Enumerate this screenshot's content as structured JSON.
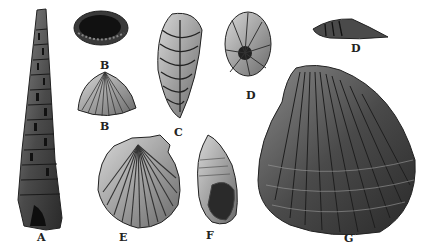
{
  "plate": {
    "subject": "Illustrated plate of fossil shells",
    "background": "#ffffff",
    "ink": "#222222",
    "specimens": [
      {
        "id": "A",
        "label": "A",
        "shape": "tall turreted gastropod (tower shell)"
      },
      {
        "id": "B1",
        "label": "B",
        "shape": "brachiopod valve, interior view"
      },
      {
        "id": "B2",
        "label": "B",
        "shape": "brachiopod valve, exterior ribbed view"
      },
      {
        "id": "C",
        "label": "C",
        "shape": "elongate chambered foraminifer"
      },
      {
        "id": "D1",
        "label": "D",
        "shape": "coiled chambered foraminifer"
      },
      {
        "id": "D2",
        "label": "D",
        "shape": "foraminifer, side view"
      },
      {
        "id": "E",
        "label": "E",
        "shape": "scallop shell (pecten)"
      },
      {
        "id": "F",
        "label": "F",
        "shape": "small whelk-like gastropod with aperture"
      },
      {
        "id": "G",
        "label": "G",
        "shape": "large ribbed bivalve (cockle/clam)"
      }
    ]
  }
}
